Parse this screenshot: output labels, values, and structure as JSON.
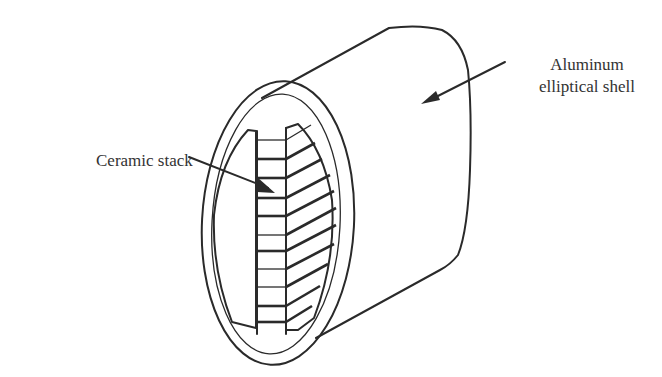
{
  "figure": {
    "type": "diagram",
    "colors": {
      "line": "#2a2a2a",
      "text": "#333333",
      "background": "#ffffff"
    }
  },
  "labels": {
    "ceramic_stack": "Ceramic stack",
    "shell_line1": "Aluminum",
    "shell_line2": "elliptical shell"
  },
  "stack": {
    "plate_count": 12
  }
}
